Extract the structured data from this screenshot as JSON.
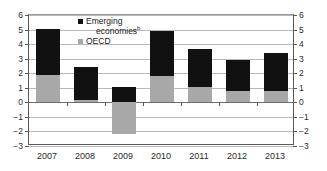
{
  "chart_data": {
    "type": "bar",
    "stacked": true,
    "title": "",
    "subtitle": "",
    "xlabel": "",
    "ylabel": "",
    "categories": [
      "2007",
      "2008",
      "2009",
      "2010",
      "2011",
      "2012",
      "2013"
    ],
    "series": [
      {
        "name": "OECD",
        "color": "#a8a8a8",
        "values": [
          1.85,
          0.15,
          -2.2,
          1.8,
          1.05,
          0.8,
          0.8
        ]
      },
      {
        "name": "Emerging economies",
        "color": "#111111",
        "values": [
          3.2,
          2.3,
          1.05,
          3.1,
          2.6,
          2.1,
          2.6
        ]
      }
    ],
    "totals": [
      5.05,
      2.45,
      1.05,
      4.9,
      3.65,
      2.9,
      3.4
    ],
    "ylim": [
      -3,
      6
    ],
    "yticks": [
      6,
      5,
      4,
      3,
      2,
      1,
      0,
      -1,
      -2,
      -3
    ],
    "ytick_labels_left": [
      "6",
      "5",
      "4",
      "3",
      "2",
      "1",
      "0",
      "−1",
      "−2",
      "−3"
    ],
    "ytick_labels_right": [
      "6",
      "5",
      "4",
      "3",
      "2",
      "1",
      "0",
      "−1",
      "−2",
      "−3"
    ],
    "grid": true,
    "legend_position": "top-center"
  },
  "legend": {
    "emerging_label": "Emerging",
    "emerging_label_cont": "economies",
    "emerging_superscript": "b",
    "oecd_label": "OECD"
  }
}
